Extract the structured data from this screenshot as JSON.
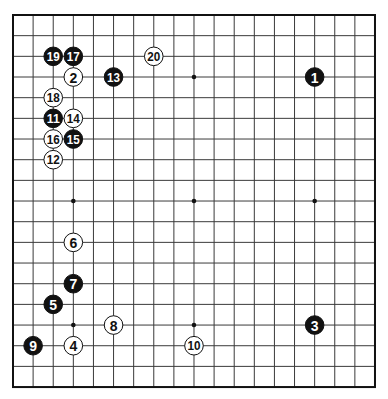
{
  "board": {
    "size": 19,
    "origin_x": 13,
    "origin_y": 15,
    "spacing_x": 20.11,
    "spacing_y": 20.67,
    "line_color": "#3a3a3a",
    "border_color": "#111111",
    "background": "#ffffff",
    "star_points": [
      [
        3,
        3
      ],
      [
        9,
        3
      ],
      [
        15,
        3
      ],
      [
        3,
        9
      ],
      [
        9,
        9
      ],
      [
        15,
        9
      ],
      [
        3,
        15
      ],
      [
        9,
        15
      ],
      [
        15,
        15
      ]
    ]
  },
  "colors": {
    "black_stone": "#111111",
    "white_stone": "#ffffff",
    "black_label": "#ffffff",
    "white_label": "#111111"
  },
  "stones": [
    {
      "move": "1",
      "color": "black",
      "col": 15,
      "row": 3
    },
    {
      "move": "2",
      "color": "white",
      "col": 3,
      "row": 3
    },
    {
      "move": "3",
      "color": "black",
      "col": 15,
      "row": 15
    },
    {
      "move": "4",
      "color": "white",
      "col": 3,
      "row": 16
    },
    {
      "move": "5",
      "color": "black",
      "col": 2,
      "row": 14
    },
    {
      "move": "6",
      "color": "white",
      "col": 3,
      "row": 11
    },
    {
      "move": "7",
      "color": "black",
      "col": 3,
      "row": 13
    },
    {
      "move": "8",
      "color": "white",
      "col": 5,
      "row": 15
    },
    {
      "move": "9",
      "color": "black",
      "col": 1,
      "row": 16
    },
    {
      "move": "10",
      "color": "white",
      "col": 9,
      "row": 16
    },
    {
      "move": "11",
      "color": "black",
      "col": 2,
      "row": 5
    },
    {
      "move": "12",
      "color": "white",
      "col": 2,
      "row": 7
    },
    {
      "move": "13",
      "color": "black",
      "col": 5,
      "row": 3
    },
    {
      "move": "14",
      "color": "white",
      "col": 3,
      "row": 5
    },
    {
      "move": "15",
      "color": "black",
      "col": 3,
      "row": 6
    },
    {
      "move": "16",
      "color": "white",
      "col": 2,
      "row": 6
    },
    {
      "move": "17",
      "color": "black",
      "col": 3,
      "row": 2
    },
    {
      "move": "18",
      "color": "white",
      "col": 2,
      "row": 4
    },
    {
      "move": "19",
      "color": "black",
      "col": 2,
      "row": 2
    },
    {
      "move": "20",
      "color": "white",
      "col": 7,
      "row": 2
    }
  ]
}
